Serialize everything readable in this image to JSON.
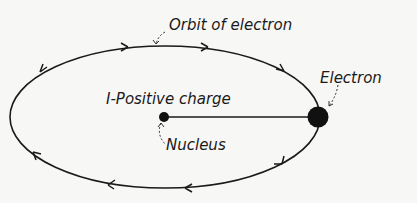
{
  "diagram": {
    "labels": {
      "orbit": "Orbit of electron",
      "electron": "Electron",
      "positive_charge": "I-Positive charge",
      "nucleus": "Nucleus"
    },
    "colors": {
      "line": "#1a1a1a",
      "background": "#f7f7f5"
    }
  }
}
